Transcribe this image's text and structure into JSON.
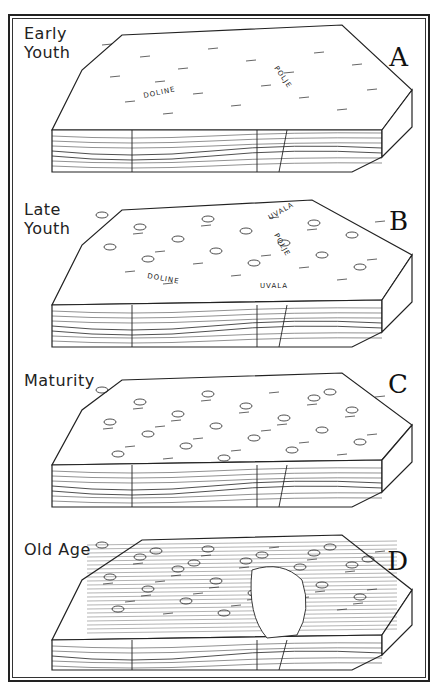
{
  "figure": {
    "panels": [
      {
        "id": "A",
        "stage": "Early\nYouth",
        "annotations": [
          "DOLINE",
          "POLJE"
        ]
      },
      {
        "id": "B",
        "stage": "Late\nYouth",
        "annotations": [
          "DOLINE",
          "UVALA",
          "UVALA",
          "POLJE"
        ]
      },
      {
        "id": "C",
        "stage": "Maturity",
        "annotations": []
      },
      {
        "id": "D",
        "stage": "Old Age",
        "annotations": []
      }
    ]
  },
  "colors": {
    "ink": "#222222",
    "paper": "#ffffff"
  }
}
